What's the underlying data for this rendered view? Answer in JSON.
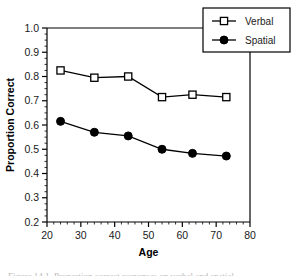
{
  "figure": {
    "background": "#ffffff",
    "frame_color": "#000000",
    "caption_partial": "Figure 14.1. Proportion correct responses on verbal and spatial"
  },
  "chart_data": {
    "type": "line",
    "title": "",
    "xlabel": "Age",
    "ylabel": "Proportion Correct",
    "xlim": [
      20,
      80
    ],
    "ylim": [
      0.2,
      1.0
    ],
    "xticks": [
      20,
      30,
      40,
      50,
      60,
      70,
      80
    ],
    "xtick_labels": [
      "20",
      "30",
      "40",
      "50",
      "60",
      "70",
      "80"
    ],
    "yticks": [
      0.2,
      0.3,
      0.4,
      0.5,
      0.6,
      0.7,
      0.8,
      0.9,
      1.0
    ],
    "ytick_labels": [
      "0.2",
      "0.3",
      "0.4",
      "0.5",
      "0.6",
      "0.7",
      "0.8",
      "0.9",
      "1.0"
    ],
    "minor_ticks": true,
    "grid": false,
    "legend_position": "top-right",
    "x": [
      24,
      34,
      44,
      54,
      63,
      73
    ],
    "series": [
      {
        "name": "Verbal",
        "marker": "open-square",
        "color": "#000000",
        "values": [
          0.825,
          0.795,
          0.8,
          0.715,
          0.725,
          0.715
        ]
      },
      {
        "name": "Spatial",
        "marker": "filled-circle",
        "color": "#000000",
        "values": [
          0.615,
          0.57,
          0.555,
          0.5,
          0.483,
          0.472
        ]
      }
    ]
  }
}
